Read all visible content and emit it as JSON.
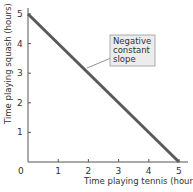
{
  "chart_data": {
    "type": "line",
    "title": "",
    "xlabel": "Time playing tennis (hours)",
    "ylabel": "Time playing squash (hours)",
    "xlim": [
      0,
      5
    ],
    "ylim": [
      0,
      5
    ],
    "x_ticks": [
      "0",
      "1",
      "2",
      "3",
      "4",
      "5"
    ],
    "y_ticks": [
      "1",
      "2",
      "3",
      "4",
      "5"
    ],
    "grid": false,
    "series": [
      {
        "name": "Negative constant slope",
        "x": [
          0,
          5
        ],
        "y": [
          5,
          0
        ],
        "color": "#5a5a5a"
      }
    ],
    "annotations": [
      {
        "text": [
          "Negative",
          "constant",
          "slope"
        ],
        "points_to": [
          2.5,
          2.5
        ]
      }
    ]
  }
}
